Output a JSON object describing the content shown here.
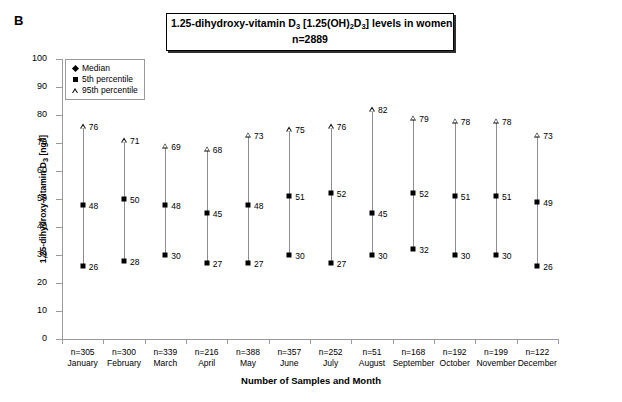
{
  "panel_label": "B",
  "title": {
    "line1_prefix": "1.25-dihydroxy-vitamin D",
    "line1_sub1": "3",
    "line1_mid": "  [1.25(OH)",
    "line1_sub2": "2",
    "line1_mid2": "D",
    "line1_sub3": "3",
    "line1_suffix": "] levels in women",
    "line2": "n=2889"
  },
  "legend": {
    "items": [
      {
        "label": "Median",
        "marker": "diamond-marker"
      },
      {
        "label": "5th percentile",
        "marker": "square-marker"
      },
      {
        "label": "95th percentile",
        "marker": "triangle-marker"
      }
    ]
  },
  "axes": {
    "y_title_prefix": "1,25-dihydroxy-vitamin D",
    "y_title_sub": "3",
    "y_title_suffix": " [ng/l]",
    "x_title": "Number of Samples and Month"
  },
  "chart_data": {
    "type": "scatter",
    "title": "1.25-dihydroxy-vitamin D3 [1.25(OH)2D3] levels in women n=2889",
    "xlabel": "Number of Samples and Month",
    "ylabel": "1,25-dihydroxy-vitamin D3 [ng/l]",
    "ylim": [
      0,
      100
    ],
    "yticks": [
      0,
      10,
      20,
      30,
      40,
      50,
      60,
      70,
      80,
      90,
      100
    ],
    "grid": false,
    "legend_position": "top-left",
    "categories": [
      "January",
      "February",
      "March",
      "April",
      "May",
      "June",
      "July",
      "August",
      "September",
      "October",
      "November",
      "December"
    ],
    "sample_counts": [
      "n=305",
      "n=300",
      "n=339",
      "n=216",
      "n=388",
      "n=357",
      "n=252",
      "n=51",
      "n=168",
      "n=192",
      "n=199",
      "n=122"
    ],
    "series": [
      {
        "name": "5th percentile",
        "values": [
          26,
          28,
          30,
          27,
          27,
          30,
          27,
          30,
          32,
          30,
          30,
          26
        ]
      },
      {
        "name": "Median",
        "values": [
          48,
          50,
          48,
          45,
          48,
          51,
          52,
          45,
          52,
          51,
          51,
          49
        ]
      },
      {
        "name": "95th percentile",
        "values": [
          76,
          71,
          69,
          68,
          73,
          75,
          76,
          82,
          79,
          78,
          78,
          73
        ]
      }
    ]
  }
}
